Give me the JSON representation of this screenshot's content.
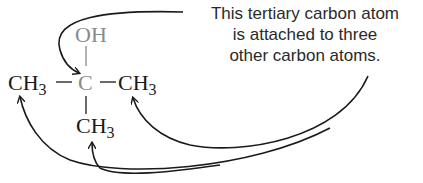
{
  "diagram": {
    "molecule": {
      "hydroxyl": "OH",
      "central_carbon": "C",
      "methyl_left": {
        "base": "CH",
        "sub": "3"
      },
      "methyl_right": {
        "base": "CH",
        "sub": "3"
      },
      "methyl_bottom": {
        "base": "CH",
        "sub": "3"
      },
      "bond_horizontal": "–"
    },
    "caption": {
      "line1": "This tertiary carbon atom",
      "line2": "is attached to three",
      "line3": "other carbon atoms."
    },
    "colors": {
      "highlight_grey": "#8a8a8a",
      "text": "#1a1a1a",
      "arrows": "#1a1a1a"
    }
  }
}
